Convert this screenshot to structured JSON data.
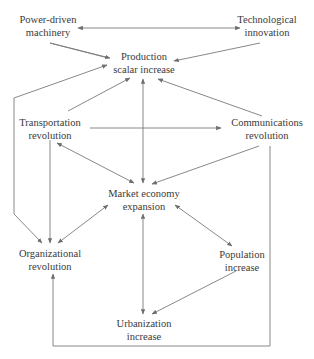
{
  "diagram": {
    "type": "causal-flow-diagram",
    "nodes": [
      {
        "id": "power",
        "line1": "Power-driven",
        "line2": "machinery"
      },
      {
        "id": "tech",
        "line1": "Technological",
        "line2": "innovation"
      },
      {
        "id": "production",
        "line1": "Production",
        "line2": "scalar increase"
      },
      {
        "id": "transport",
        "line1": "Transportation",
        "line2": "revolution"
      },
      {
        "id": "comms",
        "line1": "Communications",
        "line2": "revolution"
      },
      {
        "id": "market",
        "line1": "Market economy",
        "line2": "expansion"
      },
      {
        "id": "org",
        "line1": "Organizational",
        "line2": "revolution"
      },
      {
        "id": "population",
        "line1": "Population",
        "line2": "increase"
      },
      {
        "id": "urban",
        "line1": "Urbanization",
        "line2": "increase"
      }
    ],
    "edges": [
      {
        "from": "power",
        "to": "tech",
        "bidirectional": true
      },
      {
        "from": "power",
        "to": "production",
        "bidirectional": false
      },
      {
        "from": "tech",
        "to": "production",
        "bidirectional": false
      },
      {
        "from": "transport",
        "to": "production",
        "bidirectional": false
      },
      {
        "from": "comms",
        "to": "production",
        "bidirectional": false
      },
      {
        "from": "transport",
        "to": "comms",
        "bidirectional": false
      },
      {
        "from": "transport",
        "to": "market",
        "bidirectional": true
      },
      {
        "from": "comms",
        "to": "market",
        "bidirectional": false
      },
      {
        "from": "production",
        "to": "market",
        "bidirectional": true
      },
      {
        "from": "market",
        "to": "urban",
        "bidirectional": true
      },
      {
        "from": "market",
        "to": "org",
        "bidirectional": true
      },
      {
        "from": "market",
        "to": "population",
        "bidirectional": true
      },
      {
        "from": "transport",
        "to": "org",
        "bidirectional": false
      },
      {
        "from": "production",
        "to": "org",
        "bidirectional": false,
        "note": "loop via left side"
      },
      {
        "from": "population",
        "to": "urban",
        "bidirectional": false
      },
      {
        "from": "comms",
        "to": "org",
        "bidirectional": false,
        "note": "loop via right side and bottom"
      }
    ],
    "colors": {
      "line": "#7a7a7a",
      "text": "#3a3a3a",
      "background": "#ffffff"
    }
  }
}
